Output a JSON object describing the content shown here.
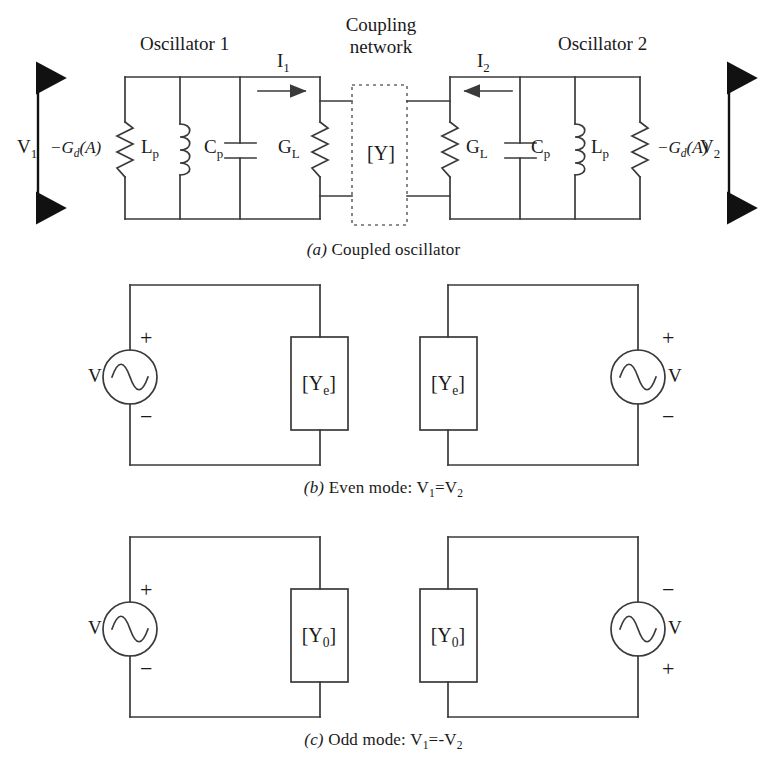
{
  "figure": {
    "title_absent": true,
    "background_color": "#ffffff",
    "line_color": "#3a3a3a",
    "text_color": "#1a1a1a"
  },
  "panel_a": {
    "caption_prefix": "(a)",
    "caption_text": " Coupled oscillator",
    "osc1_label": "Oscillator 1",
    "osc2_label": "Oscillator 2",
    "coupling_label_line1": "Coupling",
    "coupling_label_line2": "network",
    "coupling_box_label": "[Y]",
    "current1_label": "I",
    "current1_sub": "1",
    "current2_label": "I",
    "current2_sub": "2",
    "v1_label": "V",
    "v1_sub": "1",
    "v2_label": "V",
    "v2_sub": "2",
    "neg_gd_left": "−G",
    "neg_gd_left_sub": "d",
    "neg_gd_left_arg": "(A)",
    "neg_gd_right": "−G",
    "neg_gd_right_sub": "d",
    "neg_gd_right_arg": "(A)",
    "lp_left": "L",
    "lp_left_sub": "p",
    "cp_left": "C",
    "cp_left_sub": "p",
    "gl_left": "G",
    "gl_left_sub": "L",
    "gl_right": "G",
    "gl_right_sub": "L",
    "cp_right": "C",
    "cp_right_sub": "p",
    "lp_right": "L",
    "lp_right_sub": "p"
  },
  "panel_b": {
    "caption_prefix": "(b)",
    "caption_text": " Even mode: V",
    "caption_sub1": "1",
    "caption_mid": "=V",
    "caption_sub2": "2",
    "left_source_label": "V",
    "left_source_top_sign": "+",
    "left_source_bottom_sign": "−",
    "left_box_label": "[Y",
    "left_box_sub": "e",
    "left_box_suffix": "]",
    "right_source_label": "V",
    "right_source_top_sign": "+",
    "right_source_bottom_sign": "−",
    "right_box_label": "[Y",
    "right_box_sub": "e",
    "right_box_suffix": "]"
  },
  "panel_c": {
    "caption_prefix": "(c)",
    "caption_text": " Odd mode: V",
    "caption_sub1": "1",
    "caption_mid": "=-V",
    "caption_sub2": "2",
    "left_source_label": "V",
    "left_source_top_sign": "+",
    "left_source_bottom_sign": "−",
    "left_box_label": "[Y",
    "left_box_sub": "0",
    "left_box_suffix": "]",
    "right_source_label": "V",
    "right_source_top_sign": "−",
    "right_source_bottom_sign": "+",
    "right_box_label": "[Y",
    "right_box_sub": "0",
    "right_box_suffix": "]"
  }
}
